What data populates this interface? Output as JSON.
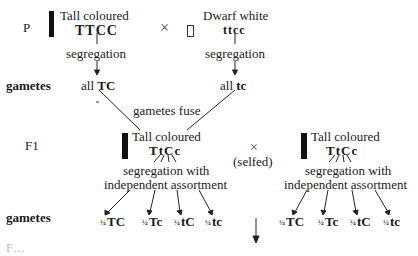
{
  "rows": {
    "parental_label": "P",
    "gametes_label": "gametes",
    "f1_label": "F1",
    "gametes_label_2": "gametes"
  },
  "parent1": {
    "phenotype": "Tall coloured",
    "genotype": "TTCC",
    "process": "segregation",
    "gametes": "all",
    "gamete_genotype": "TC"
  },
  "cross_symbol": "×",
  "parent2": {
    "phenotype": "Dwarf white",
    "genotype": "ttcc",
    "process": "segregation",
    "gametes": "all",
    "gamete_genotype": "tc"
  },
  "fusion_label": "gametes fuse",
  "f1_left": {
    "phenotype": "Tall coloured",
    "genotype": "TtCc",
    "process_line1": "segregation with",
    "process_line2": "independent assortment"
  },
  "selfed": {
    "symbol": "×",
    "label": "(selfed)"
  },
  "f1_right": {
    "phenotype": "Tall coloured",
    "genotype": "TtCc",
    "process_line1": "segregation with",
    "process_line2": "independent assortment"
  },
  "f1_gametes_left": [
    {
      "fraction": "1/4",
      "genotype": "TC"
    },
    {
      "fraction": "1/4",
      "genotype": "Tc"
    },
    {
      "fraction": "1/4",
      "genotype": "tC"
    },
    {
      "fraction": "1/4",
      "genotype": "tc"
    }
  ],
  "f1_gametes_right": [
    {
      "fraction": "1/4",
      "genotype": "TC"
    },
    {
      "fraction": "1/4",
      "genotype": "Tc"
    },
    {
      "fraction": "1/4",
      "genotype": "tC"
    },
    {
      "fraction": "1/4",
      "genotype": "tc"
    }
  ],
  "footer_partial": "F…"
}
